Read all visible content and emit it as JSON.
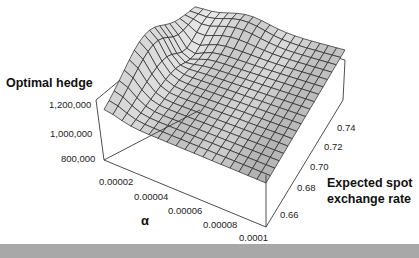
{
  "chart_data": {
    "type": "surface3d",
    "title": "",
    "zlabel": "Optimal hedge",
    "xlabel": "α",
    "ylabel": "Expected spot exchange rate",
    "ylabel_lines": [
      "Expected spot",
      "exchange rate"
    ],
    "z_ticks": [
      "800,000",
      "1,000,000",
      "1,200,000"
    ],
    "x_ticks": [
      "0.00002",
      "0.00004",
      "0.00006",
      "0.00008",
      "0.0001"
    ],
    "y_ticks": [
      "0.66",
      "0.68",
      "0.70",
      "0.72",
      "0.74"
    ],
    "zlim": [
      800000,
      1300000
    ],
    "xlim": [
      1e-05,
      0.0001
    ],
    "ylim": [
      0.65,
      0.75
    ],
    "grid": true,
    "surface_description": "Mostly flat plateau near ~1,050,000-1,100,000 across the domain, with a sharp ridge/peak rising toward ~1,250,000 at low α and low expected spot rate, and a slight rise along the back edge at high expected spot rate.",
    "mesh_size": [
      18,
      18
    ],
    "colors": {
      "surface_fill": "#d4d4d4",
      "mesh_line": "#222222",
      "box_line": "#333333"
    }
  },
  "labels": {
    "zaxis_title": "Optimal hedge",
    "xaxis_title": "α",
    "yaxis_title_line1": "Expected spot",
    "yaxis_title_line2": "exchange rate",
    "z_tick_0": "800,000",
    "z_tick_1": "1,000,000",
    "z_tick_2": "1,200,000",
    "x_tick_0": "0.00002",
    "x_tick_1": "0.00004",
    "x_tick_2": "0.00006",
    "x_tick_3": "0.00008",
    "x_tick_4": "0.0001",
    "y_tick_0": "0.66",
    "y_tick_1": "0.68",
    "y_tick_2": "0.70",
    "y_tick_3": "0.72",
    "y_tick_4": "0.74"
  }
}
